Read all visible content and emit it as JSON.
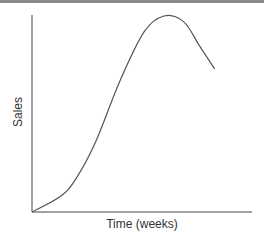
{
  "chart_data": {
    "type": "line",
    "title": "",
    "xlabel": "Time (weeks)",
    "ylabel": "Sales",
    "grid": false,
    "legend": null,
    "x_ticks": [],
    "y_ticks": [],
    "series": [
      {
        "name": "Sales",
        "description": "Product life cycle curve: slow start, rapid growth, peak, then decline",
        "points": [
          {
            "x": 0,
            "y": 0
          },
          {
            "x": 0.13,
            "y": 0.08
          },
          {
            "x": 0.2,
            "y": 0.17
          },
          {
            "x": 0.29,
            "y": 0.36
          },
          {
            "x": 0.4,
            "y": 0.67
          },
          {
            "x": 0.51,
            "y": 0.92
          },
          {
            "x": 0.6,
            "y": 1.0
          },
          {
            "x": 0.69,
            "y": 0.97
          },
          {
            "x": 0.76,
            "y": 0.85
          },
          {
            "x": 0.83,
            "y": 0.73
          }
        ]
      }
    ],
    "colors": {
      "line": "#555555",
      "axis": "#444444"
    }
  }
}
